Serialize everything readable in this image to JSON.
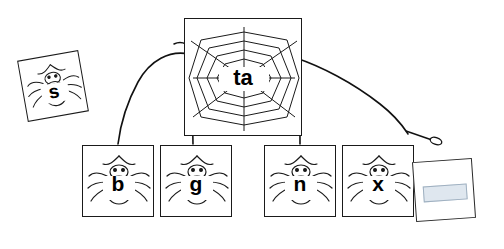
{
  "worksheet": {
    "title_word": "ta",
    "center_card": {
      "label": "ta",
      "name": "web-center-card"
    },
    "letter_cards": [
      {
        "id": "s",
        "label": "s",
        "x": 22,
        "y": 55,
        "w": 62,
        "h": 62,
        "rotate": -10
      },
      {
        "id": "b",
        "label": "b",
        "x": 82,
        "y": 145,
        "w": 72,
        "h": 72,
        "rotate": 0
      },
      {
        "id": "g",
        "label": "g",
        "x": 160,
        "y": 145,
        "w": 72,
        "h": 72,
        "rotate": 0
      },
      {
        "id": "n",
        "label": "n",
        "x": 264,
        "y": 145,
        "w": 72,
        "h": 72,
        "rotate": 0
      },
      {
        "id": "x",
        "label": "x",
        "x": 342,
        "y": 145,
        "w": 72,
        "h": 72,
        "rotate": 0
      }
    ],
    "web_card": {
      "x": 184,
      "y": 18,
      "w": 118,
      "h": 118
    },
    "sticky_note": {
      "x": 414,
      "y": 160,
      "w": 60,
      "h": 60
    },
    "pointer": {
      "label": "cursor-pointer"
    },
    "strand_color": "#111111",
    "ink_color": "#1a1a1a"
  }
}
